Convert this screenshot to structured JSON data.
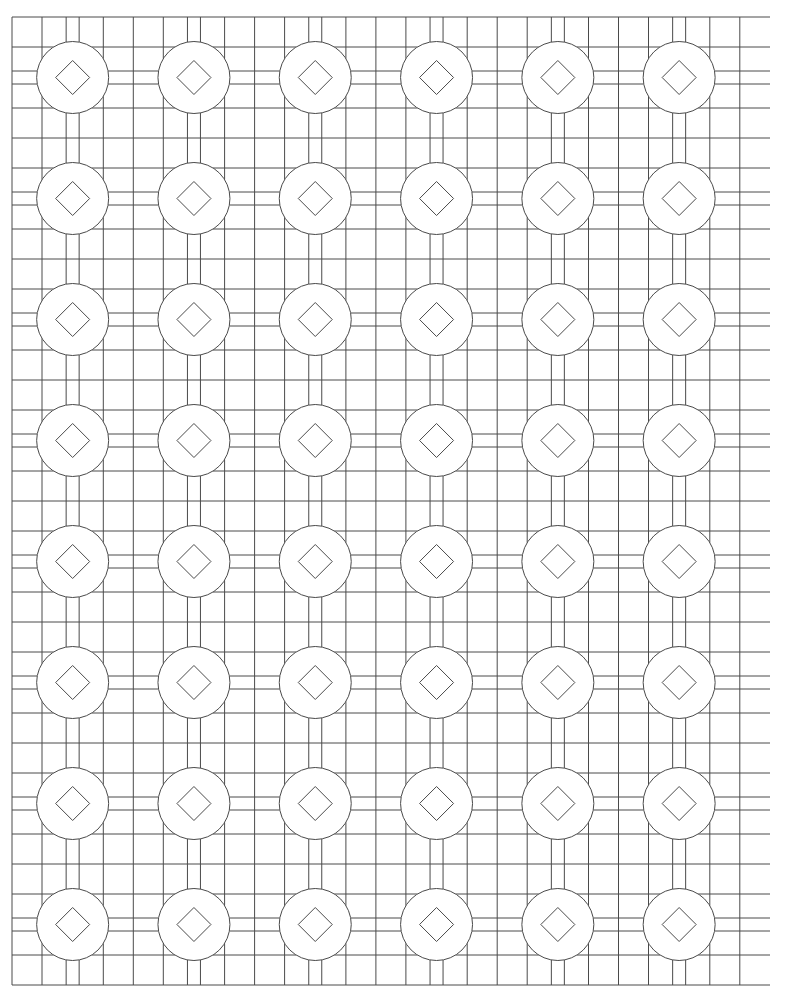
{
  "artwork": {
    "title": "Geometric Lattice Pattern",
    "description": "Repeating tile pattern of circles enclosing diamonds, set within an orthogonal grid of squares",
    "style": "line-art-outline",
    "background_color": "#ffffff",
    "stroke_color": "#4a4a4a",
    "stroke_color_dark": "#3a3a3a",
    "stroke_width": 1,
    "canvas": {
      "width": 786,
      "height": 993
    }
  },
  "grid": {
    "origin_x": 12,
    "origin_y": 17,
    "period_x": 121.3,
    "period_y": 121,
    "columns": 6,
    "rows": 8,
    "band_offset": 13,
    "square_inset": 30,
    "outer_left": 12,
    "outer_top": 17,
    "outer_right": 770,
    "outer_bottom": 985
  },
  "motif": {
    "circle": {
      "radius": 36,
      "count": 48,
      "shape": "circle-outline"
    },
    "diamond": {
      "half_diagonal": 17,
      "count": 48,
      "shape": "diamond-outline",
      "rotation_deg": 45
    },
    "square": {
      "size": 30,
      "shape": "square-outline"
    }
  },
  "legend": {
    "circle_label": "circle",
    "diamond_label": "diamond",
    "square_label": "square",
    "grid_label": "grid lines"
  },
  "chart_data": {
    "type": "table",
    "columns": [
      "element",
      "count",
      "size_px"
    ],
    "rows": [
      [
        "circle",
        48,
        72
      ],
      [
        "diamond",
        48,
        34
      ],
      [
        "square",
        96,
        30
      ]
    ]
  }
}
